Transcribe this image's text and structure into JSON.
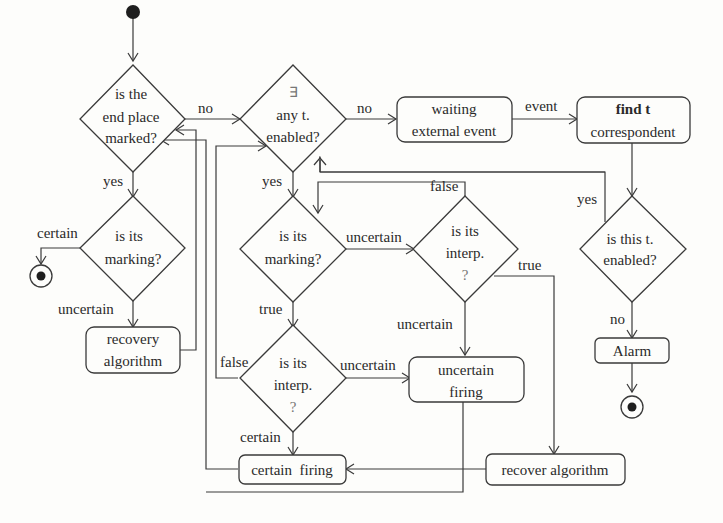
{
  "diagram": {
    "type": "flowchart",
    "nodes": {
      "start": {
        "kind": "initial"
      },
      "d_end": {
        "kind": "decision",
        "lines": [
          "is the",
          "end place",
          "marked?"
        ]
      },
      "d_any": {
        "kind": "decision",
        "lines": [
          "∃",
          "any t.",
          "enabled?"
        ]
      },
      "wait": {
        "kind": "action",
        "lines": [
          "waiting",
          "external event"
        ]
      },
      "find": {
        "kind": "action",
        "lines": [
          "find t",
          "correspondent"
        ]
      },
      "d_mark1": {
        "kind": "decision",
        "lines": [
          "is its",
          "marking?"
        ]
      },
      "end1": {
        "kind": "final"
      },
      "recovery": {
        "kind": "action",
        "lines": [
          "recovery",
          "algorithm"
        ]
      },
      "d_mark2": {
        "kind": "decision",
        "lines": [
          "is its",
          "marking?"
        ]
      },
      "d_interp1": {
        "kind": "decision",
        "lines": [
          "is its",
          "interp.",
          "?"
        ]
      },
      "d_thist": {
        "kind": "decision",
        "lines": [
          "is this t.",
          "enabled?"
        ]
      },
      "alarm": {
        "kind": "action",
        "lines": [
          "Alarm"
        ]
      },
      "end2": {
        "kind": "final"
      },
      "d_interp2": {
        "kind": "decision",
        "lines": [
          "is its",
          "interp.",
          "?"
        ]
      },
      "uncertain_firing": {
        "kind": "action",
        "lines": [
          "uncertain",
          "firing"
        ]
      },
      "certain_firing": {
        "kind": "action",
        "lines": [
          "certain  firing"
        ]
      },
      "recover_alg": {
        "kind": "action",
        "lines": [
          "recover algorithm"
        ]
      }
    },
    "edge_labels": {
      "end_no": "no",
      "end_yes": "yes",
      "any_no": "no",
      "any_yes": "yes",
      "wait_event": "event",
      "mark1_certain": "certain",
      "mark1_uncertain": "uncertain",
      "mark2_uncertain": "uncertain",
      "mark2_true": "true",
      "interp1_false": "false",
      "interp1_true": "true",
      "interp1_uncertain": "uncertain",
      "thist_yes": "yes",
      "thist_no": "no",
      "interp2_false": "false",
      "interp2_uncertain": "uncertain",
      "interp2_certain": "certain"
    }
  }
}
